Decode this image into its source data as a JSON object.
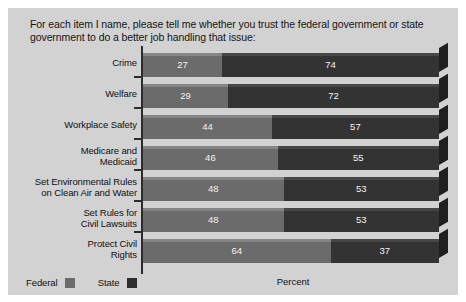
{
  "title": "For each item I name, please tell me whether you trust the federal government or state government to do a better job handling that issue:",
  "legend": {
    "federal_label": "Federal",
    "state_label": "State"
  },
  "xlabel": "Percent",
  "colors": {
    "federal": "#6b6b6b",
    "state": "#333333",
    "panel_background": "#d2d2d2",
    "page_background": "#ffffff",
    "axis": "#2c2c2c",
    "value_text": "#f2f2f2"
  },
  "chart_data": {
    "type": "bar",
    "orientation": "horizontal",
    "stacked": true,
    "title": "For each item I name, please tell me whether you trust the federal government or state government to do a better job handling that issue:",
    "xlabel": "Percent",
    "ylabel": "",
    "grid": false,
    "legend_position": "bottom-left",
    "xlim": [
      0,
      101
    ],
    "categories": [
      "Crime",
      "Welfare",
      "Workplace Safety",
      "Medicare and Medicaid",
      "Set Environmental Rules on Clean Air and Water",
      "Set Rules for Civil Lawsuits",
      "Protect Civil Rights"
    ],
    "series": [
      {
        "name": "Federal",
        "values": [
          27,
          29,
          44,
          46,
          48,
          48,
          64
        ]
      },
      {
        "name": "State",
        "values": [
          74,
          72,
          57,
          55,
          53,
          53,
          37
        ]
      }
    ]
  },
  "rows": [
    {
      "label_line1": "Crime",
      "label_line2": "",
      "federal": 27,
      "state": 74,
      "federal_text": "27",
      "state_text": "74"
    },
    {
      "label_line1": "Welfare",
      "label_line2": "",
      "federal": 29,
      "state": 72,
      "federal_text": "29",
      "state_text": "72"
    },
    {
      "label_line1": "Workplace Safety",
      "label_line2": "",
      "federal": 44,
      "state": 57,
      "federal_text": "44",
      "state_text": "57"
    },
    {
      "label_line1": "Medicare and",
      "label_line2": "Medicaid",
      "federal": 46,
      "state": 55,
      "federal_text": "46",
      "state_text": "55"
    },
    {
      "label_line1": "Set Environmental Rules",
      "label_line2": "on Clean Air and Water",
      "federal": 48,
      "state": 53,
      "federal_text": "48",
      "state_text": "53"
    },
    {
      "label_line1": "Set Rules for",
      "label_line2": "Civil Lawsuits",
      "federal": 48,
      "state": 53,
      "federal_text": "48",
      "state_text": "53"
    },
    {
      "label_line1": "Protect Civil",
      "label_line2": "Rights",
      "federal": 64,
      "state": 37,
      "federal_text": "64",
      "state_text": "37"
    }
  ]
}
